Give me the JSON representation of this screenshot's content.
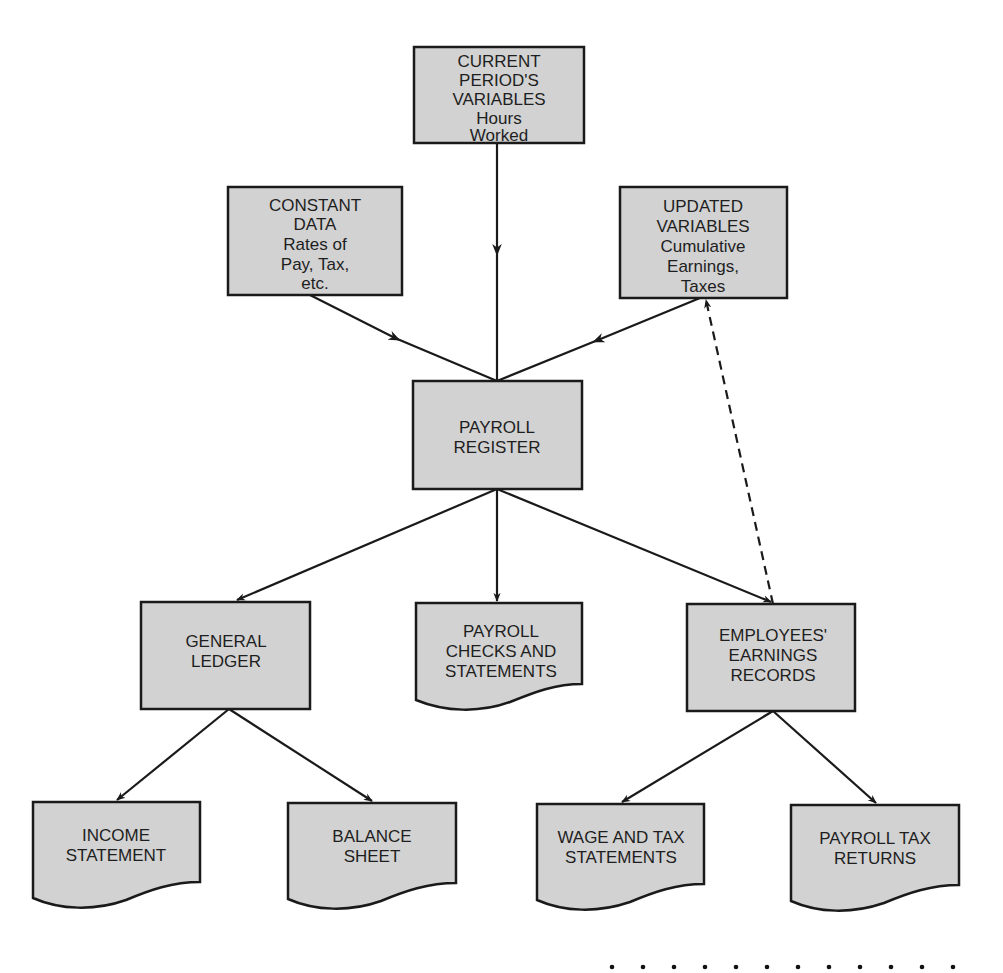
{
  "diagram": {
    "type": "flowchart",
    "title": "",
    "colors": {
      "box_fill": "#d2d2d2",
      "stroke": "#1a1a1a",
      "text": "#1e1e1e",
      "background": "#ffffff"
    },
    "nodes": [
      {
        "id": "current_period",
        "shape": "rectangle",
        "lines": [
          "CURRENT",
          "PERIOD'S",
          "VARIABLES",
          "Hours",
          "Worked"
        ]
      },
      {
        "id": "constant_data",
        "shape": "rectangle",
        "lines": [
          "CONSTANT",
          "DATA",
          "Rates of",
          "Pay, Tax,",
          "etc."
        ]
      },
      {
        "id": "updated_variables",
        "shape": "rectangle",
        "lines": [
          "UPDATED",
          "VARIABLES",
          "Cumulative",
          "Earnings,",
          "Taxes"
        ]
      },
      {
        "id": "payroll_register",
        "shape": "rectangle",
        "lines": [
          "PAYROLL",
          "REGISTER"
        ]
      },
      {
        "id": "general_ledger",
        "shape": "rectangle",
        "lines": [
          "GENERAL",
          "LEDGER"
        ]
      },
      {
        "id": "payroll_checks",
        "shape": "document",
        "lines": [
          "PAYROLL",
          "CHECKS AND",
          "STATEMENTS"
        ]
      },
      {
        "id": "employees_earnings",
        "shape": "rectangle",
        "lines": [
          "EMPLOYEES'",
          "EARNINGS",
          "RECORDS"
        ]
      },
      {
        "id": "income_statement",
        "shape": "document",
        "lines": [
          "INCOME",
          "STATEMENT"
        ]
      },
      {
        "id": "balance_sheet",
        "shape": "document",
        "lines": [
          "BALANCE",
          "SHEET"
        ]
      },
      {
        "id": "wage_tax",
        "shape": "document",
        "lines": [
          "WAGE AND TAX",
          "STATEMENTS"
        ]
      },
      {
        "id": "payroll_tax_returns",
        "shape": "document",
        "lines": [
          "PAYROLL TAX",
          "RETURNS"
        ]
      }
    ],
    "edges": [
      {
        "from": "current_period",
        "to": "payroll_register",
        "style": "solid"
      },
      {
        "from": "constant_data",
        "to": "payroll_register",
        "style": "solid"
      },
      {
        "from": "updated_variables",
        "to": "payroll_register",
        "style": "solid"
      },
      {
        "from": "payroll_register",
        "to": "general_ledger",
        "style": "solid"
      },
      {
        "from": "payroll_register",
        "to": "payroll_checks",
        "style": "solid"
      },
      {
        "from": "payroll_register",
        "to": "employees_earnings",
        "style": "solid"
      },
      {
        "from": "employees_earnings",
        "to": "updated_variables",
        "style": "dashed"
      },
      {
        "from": "general_ledger",
        "to": "income_statement",
        "style": "solid"
      },
      {
        "from": "general_ledger",
        "to": "balance_sheet",
        "style": "solid"
      },
      {
        "from": "employees_earnings",
        "to": "wage_tax",
        "style": "solid"
      },
      {
        "from": "employees_earnings",
        "to": "payroll_tax_returns",
        "style": "solid"
      }
    ],
    "footer_dots": 12
  }
}
